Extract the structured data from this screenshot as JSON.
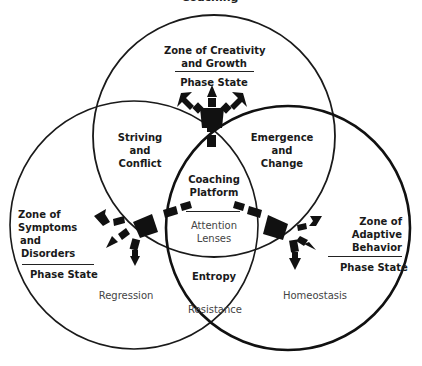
{
  "diagram": {
    "title_cutoff": "Coaching",
    "zones": {
      "top": {
        "title_line1": "Zone of Creativity",
        "title_line2": "and Growth",
        "state": "Phase State"
      },
      "left": {
        "title_line1": "Zone of",
        "title_line2": "Symptoms",
        "title_line3": "and",
        "title_line4": "Disorders",
        "state": "Phase State"
      },
      "right": {
        "title_line1": "Zone of",
        "title_line2": "Adaptive",
        "title_line3": "Behavior",
        "state": "Phase State"
      }
    },
    "overlaps": {
      "top_left": {
        "line1": "Striving",
        "line2": "and",
        "line3": "Conflict"
      },
      "top_right": {
        "line1": "Emergence",
        "line2": "and",
        "line3": "Change"
      },
      "center": {
        "line1": "Coaching",
        "line2": "Platform",
        "sub1": "Attention",
        "sub2": "Lenses"
      },
      "bottom": {
        "label": "Entropy"
      }
    },
    "outcomes": {
      "left": "Regression",
      "right": "Homeostasis",
      "bottom": "Resistance"
    },
    "colors": {
      "stroke": "#1a1a1a",
      "background": "#ffffff"
    }
  }
}
